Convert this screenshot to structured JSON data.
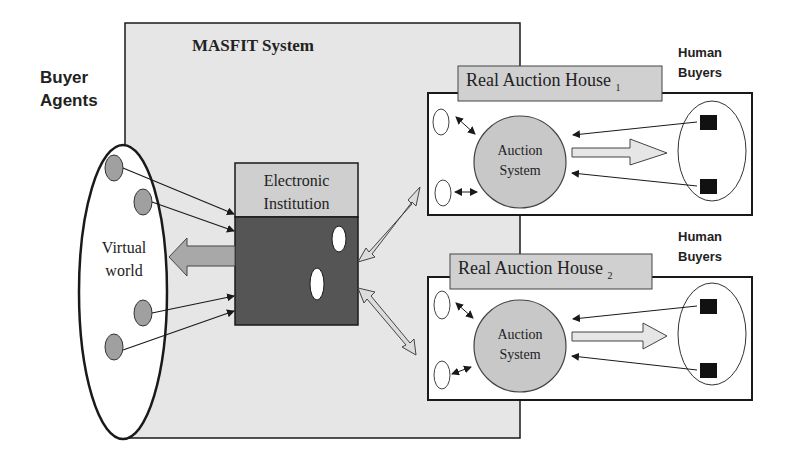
{
  "diagram": {
    "masfit": {
      "title": "MASFIT System",
      "fill": "#e6e6e6"
    },
    "buyer_agents": {
      "label_line1": "Buyer",
      "label_line2": "Agents"
    },
    "virtual_world": {
      "label_line1": "Virtual",
      "label_line2": "world"
    },
    "electronic_institution": {
      "label_line1": "Electronic",
      "label_line2": "Institution",
      "header_fill": "#cfcfcf",
      "body_fill": "#555555"
    },
    "auction_houses": [
      {
        "label": "Real Auction House",
        "subscript": "1",
        "system_line1": "Auction",
        "system_line2": "System",
        "buyers_line1": "Human",
        "buyers_line2": "Buyers"
      },
      {
        "label": "Real Auction House",
        "subscript": "2",
        "system_line1": "Auction",
        "system_line2": "System",
        "buyers_line1": "Human",
        "buyers_line2": "Buyers"
      }
    ],
    "colors": {
      "agent": "#a0a0a0",
      "auction_system": "#c8c8c8",
      "label_box": "#d0d0d0",
      "arrow_fill": "#dcdcdc",
      "stroke": "#1a1a1a"
    }
  }
}
